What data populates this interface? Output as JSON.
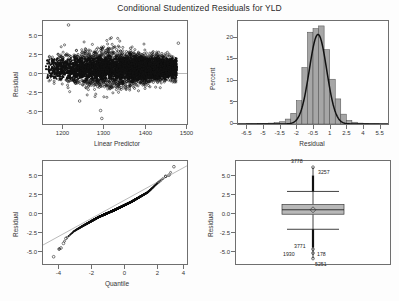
{
  "title": "Conditional Studentized Residuals for YLD",
  "chart_data": [
    {
      "type": "scatter",
      "panel": "top-left",
      "title": "",
      "xlabel": "Linear Predictor",
      "ylabel": "Residual",
      "xlim": [
        1160,
        1510
      ],
      "ylim": [
        -7.0,
        6.0
      ],
      "xticks": [
        1200,
        1300,
        1400,
        1500
      ],
      "yticks": [
        5.0,
        2.5,
        0.0,
        -2.5,
        -5.0
      ],
      "ytick_labels": [
        "5.0",
        "2.5",
        "0.0",
        "-2.5",
        "-5.0"
      ],
      "xtick_labels": [
        "1200",
        "1300",
        "1400",
        "1500"
      ],
      "grid": false,
      "reference_line_y": 0.0,
      "n_points": 5400,
      "description": "Dense horizontal band of residuals centered at 0, spread widest near x=1300, sparse outliers to +5.5 and -6.3",
      "notable_points": [
        {
          "x": 1222,
          "y": 5.5
        },
        {
          "x": 1300,
          "y": -5.3
        },
        {
          "x": 1303,
          "y": -6.3
        },
        {
          "x": 1249,
          "y": -4.1
        },
        {
          "x": 1489,
          "y": 3.2
        }
      ]
    },
    {
      "type": "bar",
      "panel": "top-right",
      "title": "",
      "xlabel": "Residual",
      "ylabel": "Percent",
      "xlim": [
        -7.25,
        6.25
      ],
      "ylim": [
        0,
        23
      ],
      "xticks": [
        -6.5,
        -5,
        -3.5,
        -2,
        -0.5,
        1,
        2.5,
        4,
        5.5
      ],
      "xtick_labels": [
        "-6.5",
        "-5",
        "-3.5",
        "-2",
        "-0.5",
        "1",
        "2.5",
        "4",
        "5.5"
      ],
      "yticks": [
        0,
        5,
        10,
        15,
        20
      ],
      "ytick_labels": [
        "0",
        "5",
        "10",
        "15",
        "20"
      ],
      "grid": false,
      "bin_width": 0.5,
      "bin_centers": [
        -6.25,
        -5.75,
        -5.25,
        -4.75,
        -4.25,
        -3.75,
        -3.25,
        -2.75,
        -2.25,
        -1.75,
        -1.25,
        -0.75,
        -0.25,
        0.25,
        0.75,
        1.25,
        1.75,
        2.25,
        2.75,
        3.25,
        3.75,
        4.25,
        4.75,
        5.25
      ],
      "values": [
        0.05,
        0.05,
        0.1,
        0.15,
        0.2,
        0.3,
        0.5,
        1.1,
        2.4,
        5.2,
        12.6,
        20.5,
        21.3,
        21.9,
        16.6,
        10.0,
        5.6,
        2.2,
        0.8,
        0.4,
        0.2,
        0.1,
        0.05,
        0.05
      ],
      "overlay_curve": "normal density",
      "curve_peak": 20.0,
      "curve_mean": -0.05,
      "curve_sd": 0.78
    },
    {
      "type": "scatter",
      "panel": "bottom-left",
      "subtype": "qq-plot",
      "title": "",
      "xlabel": "Quantile",
      "ylabel": "Residual",
      "xlim": [
        -4.4,
        4.4
      ],
      "ylim": [
        -7.3,
        6.2
      ],
      "xticks": [
        -4,
        -2,
        0,
        2,
        4
      ],
      "xtick_labels": [
        "-4",
        "-2",
        "0",
        "2",
        "4"
      ],
      "yticks": [
        5.0,
        2.5,
        0.0,
        -2.5,
        -5.0
      ],
      "ytick_labels": [
        "5.0",
        "2.5",
        "0.0",
        "-2.5",
        "-5.0"
      ],
      "grid": false,
      "reference_line": {
        "slope": 1.18,
        "intercept": 0.38
      },
      "description": "S-shaped heavy-tailed normal quantile plot; dense center, departures at both tails",
      "sample_points": [
        {
          "x": -3.75,
          "y": -6.35
        },
        {
          "x": -3.42,
          "y": -5.35
        },
        {
          "x": -3.3,
          "y": -5.2
        },
        {
          "x": -3.15,
          "y": -4.6
        },
        {
          "x": -3.0,
          "y": -3.95
        },
        {
          "x": -2.5,
          "y": -3.0
        },
        {
          "x": -2.0,
          "y": -2.35
        },
        {
          "x": -1.0,
          "y": -1.15
        },
        {
          "x": 0.0,
          "y": -0.2
        },
        {
          "x": 1.0,
          "y": 0.85
        },
        {
          "x": 2.0,
          "y": 2.1
        },
        {
          "x": 2.6,
          "y": 3.3
        },
        {
          "x": 3.1,
          "y": 4.2
        },
        {
          "x": 3.3,
          "y": 4.35
        },
        {
          "x": 3.6,
          "y": 5.45
        }
      ]
    },
    {
      "type": "boxplot",
      "panel": "bottom-right",
      "title": "",
      "xlabel": "",
      "ylabel": "Residual",
      "ylim": [
        -7.0,
        6.2
      ],
      "yticks": [
        5.0,
        2.5,
        0.0,
        -2.5,
        -5.0
      ],
      "ytick_labels": [
        "5.0",
        "2.5",
        "0.0",
        "-2.5",
        "-5.0"
      ],
      "grid": false,
      "box": {
        "q1": -0.62,
        "median": -0.05,
        "q3": 0.62,
        "mean": -0.05,
        "whisker_low": -2.55,
        "whisker_high": 2.3
      },
      "outlier_labels": [
        {
          "id": "3778",
          "y": 5.4,
          "position": "above-left"
        },
        {
          "id": "3257",
          "y": 4.3,
          "position": "right"
        },
        {
          "id": "3771",
          "y": -5.1,
          "position": "left"
        },
        {
          "id": "1930",
          "y": -5.6,
          "position": "far-left"
        },
        {
          "id": "178",
          "y": -5.6,
          "position": "right"
        },
        {
          "id": "5251",
          "y": -6.3,
          "position": "below"
        }
      ]
    }
  ]
}
